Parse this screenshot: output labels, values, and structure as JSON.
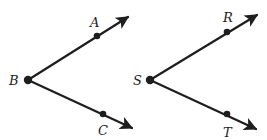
{
  "figure": {
    "angles": [
      {
        "name": "angle-ABC",
        "vertex": {
          "label": "B",
          "x": 28,
          "y": 80
        },
        "rays": [
          {
            "point": {
              "label": "A",
              "x": 97,
              "y": 36
            },
            "tip": {
              "x": 130,
              "y": 16
            }
          },
          {
            "point": {
              "label": "C",
              "x": 103,
              "y": 114
            },
            "tip": {
              "x": 134,
              "y": 129
            }
          }
        ]
      },
      {
        "name": "angle-RST",
        "vertex": {
          "label": "S",
          "x": 150,
          "y": 80
        },
        "rays": [
          {
            "point": {
              "label": "R",
              "x": 227,
              "y": 32
            },
            "tip": {
              "x": 259,
              "y": 14
            }
          },
          {
            "point": {
              "label": "T",
              "x": 227,
              "y": 114
            },
            "tip": {
              "x": 258,
              "y": 130
            }
          }
        ]
      }
    ],
    "labels": {
      "A": "A",
      "B": "B",
      "C": "C",
      "R": "R",
      "S": "S",
      "T": "T"
    },
    "colors": {
      "ink": "#1e1e1e",
      "background": "#ffffff"
    }
  }
}
